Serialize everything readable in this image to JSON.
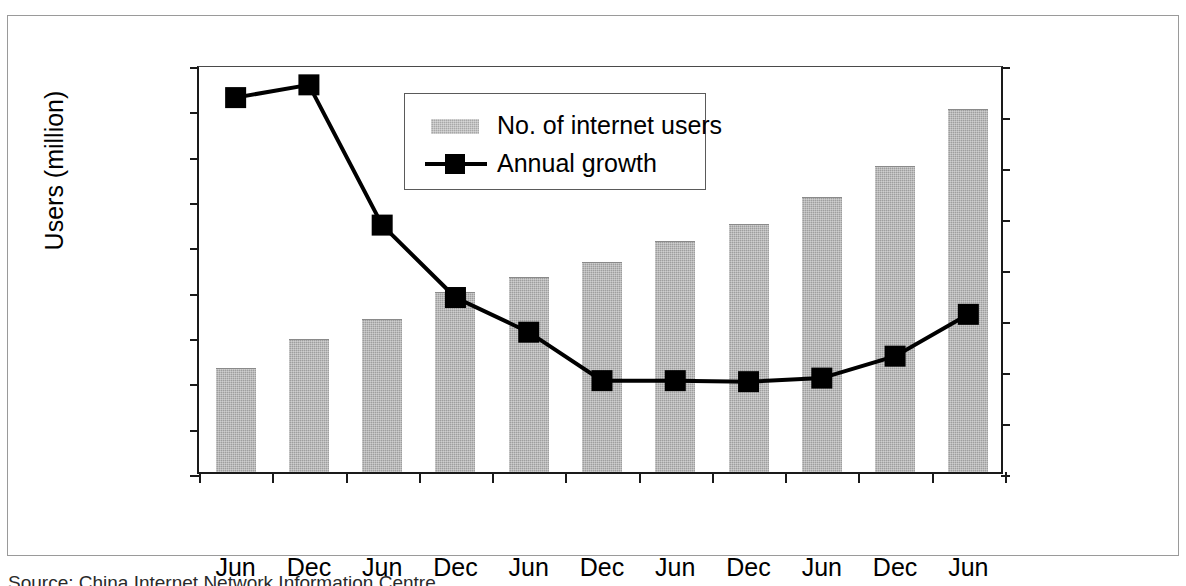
{
  "figure": {
    "source_note": "Source: China Internet Network Information Centre"
  },
  "chart_data": {
    "type": "bar",
    "title": "",
    "xlabel": "",
    "ylabel": "Users (million)",
    "y2label": "Annual growth (%)",
    "ylim": [
      0,
      180
    ],
    "y2lim": [
      0,
      80
    ],
    "yticks": [
      0,
      20,
      40,
      60,
      80,
      100,
      120,
      140,
      160,
      180
    ],
    "y2ticks": [
      0,
      10,
      20,
      30,
      40,
      50,
      60,
      70,
      80
    ],
    "grid": false,
    "legend_position": "upper-center",
    "categories": [
      "Jun",
      "Dec",
      "Jun",
      "Dec",
      "Jun",
      "Dec",
      "Jun",
      "Dec",
      "Jun",
      "Dec",
      "Jun"
    ],
    "year_groups": [
      {
        "year": "2002",
        "span": 2
      },
      {
        "year": "2003",
        "span": 2
      },
      {
        "year": "2004",
        "span": 2
      },
      {
        "year": "2005",
        "span": 2
      },
      {
        "year": "2006",
        "span": 2
      },
      {
        "year": "2007",
        "span": 1
      }
    ],
    "series": [
      {
        "name": "No. of internet users",
        "kind": "bar",
        "axis": "left",
        "unit": "million",
        "color": "#9e9e9e",
        "values": [
          45.8,
          58.5,
          67.5,
          79.5,
          86.0,
          92.6,
          101.7,
          109.5,
          121.5,
          135.0,
          160.0
        ]
      },
      {
        "name": "Annual growth",
        "kind": "line",
        "axis": "right",
        "unit": "%",
        "color": "#000000",
        "marker": "square",
        "values": [
          74.0,
          76.5,
          49.0,
          34.8,
          28.0,
          18.5,
          18.5,
          18.3,
          19.0,
          23.3,
          31.5
        ]
      }
    ]
  },
  "legend": {
    "items": [
      {
        "label": "No. of internet users",
        "key": "bar-swatch"
      },
      {
        "label": "Annual growth",
        "key": "line-marker"
      }
    ]
  },
  "axes": {
    "left_title": "Users (million)",
    "right_title": "Annual growth (%)"
  }
}
